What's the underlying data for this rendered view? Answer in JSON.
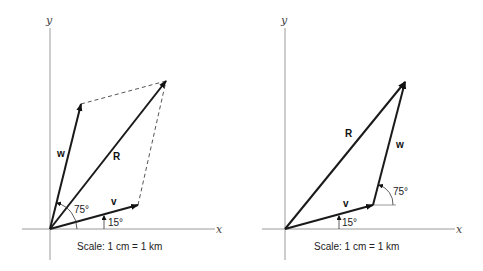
{
  "diagrams": [
    {
      "name": "parallelogram-method",
      "axis_labels": {
        "x": "x",
        "y": "y"
      },
      "vectors": {
        "v": "v",
        "w": "w",
        "R": "R"
      },
      "angles": {
        "v_angle": "15°",
        "w_angle": "75°"
      },
      "scale": "Scale: 1 cm = 1 km"
    },
    {
      "name": "triangle-method",
      "axis_labels": {
        "x": "x",
        "y": "y"
      },
      "vectors": {
        "v": "v",
        "w": "w",
        "R": "R"
      },
      "angles": {
        "v_angle": "15°",
        "w_angle": "75°"
      },
      "scale": "Scale: 1 cm = 1 km"
    }
  ]
}
